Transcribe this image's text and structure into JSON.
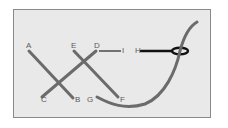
{
  "diagram": {
    "colors": {
      "background": "#e9e9e9",
      "frame": "#8a8a8a",
      "thread": "#6b6b6b",
      "needle": "#111111",
      "label": "#5a5a5a"
    },
    "labels": {
      "A": "A",
      "B": "B",
      "C": "C",
      "D": "D",
      "E": "E",
      "F": "F",
      "G": "G",
      "H": "H",
      "I": "I"
    },
    "stitches": [
      {
        "from": "A",
        "to": "B"
      },
      {
        "from": "C",
        "to": "D"
      },
      {
        "from": "E",
        "to": "F"
      },
      {
        "from": "D",
        "to": "I",
        "style": "thin"
      },
      {
        "from": "G",
        "to": "thread-end",
        "style": "curve"
      }
    ]
  }
}
